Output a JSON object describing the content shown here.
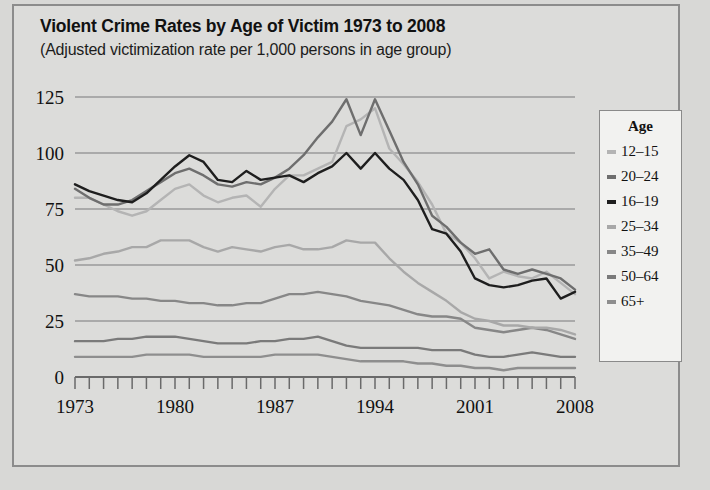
{
  "chart_data": {
    "type": "line",
    "title": "Violent Crime Rates by Age of Victim 1973 to 2008",
    "subtitle": "(Adjusted victimization rate per 1,000 persons in age group)",
    "xlabel": "",
    "ylabel": "",
    "xlim": [
      1973,
      2008
    ],
    "ylim": [
      0,
      125
    ],
    "yticks": [
      0,
      25,
      50,
      75,
      100,
      125
    ],
    "ytick_labels": [
      "0",
      "25",
      "50",
      "75",
      "100",
      "125"
    ],
    "xticks": [
      1973,
      1974,
      1975,
      1976,
      1977,
      1978,
      1979,
      1980,
      1981,
      1982,
      1983,
      1984,
      1985,
      1986,
      1987,
      1988,
      1989,
      1990,
      1991,
      1992,
      1993,
      1994,
      1995,
      1996,
      1997,
      1998,
      1999,
      2000,
      2001,
      2002,
      2003,
      2004,
      2005,
      2006,
      2007,
      2008
    ],
    "xtick_labels": [
      "1973",
      "1980",
      "1987",
      "1994",
      "2001",
      "2008"
    ],
    "xtick_label_years": [
      1973,
      1980,
      1987,
      1994,
      2001,
      2008
    ],
    "grid": true,
    "grid_axis": "y",
    "legend_position": "right",
    "legend_title": "Age",
    "x": [
      1973,
      1974,
      1975,
      1976,
      1977,
      1978,
      1979,
      1980,
      1981,
      1982,
      1983,
      1984,
      1985,
      1986,
      1987,
      1988,
      1989,
      1990,
      1991,
      1992,
      1993,
      1994,
      1995,
      1996,
      1997,
      1998,
      1999,
      2000,
      2001,
      2002,
      2003,
      2004,
      2005,
      2006,
      2007,
      2008
    ],
    "series": [
      {
        "name": "12–15",
        "color": "#b4b4b4",
        "values": [
          80,
          80,
          77,
          74,
          72,
          74,
          79,
          84,
          86,
          81,
          78,
          80,
          81,
          76,
          84,
          90,
          90,
          93,
          96,
          112,
          115,
          120,
          102,
          95,
          87,
          77,
          64,
          60,
          53,
          44,
          47,
          45,
          44,
          47,
          42,
          37
        ]
      },
      {
        "name": "20–24",
        "color": "#6e6e6e",
        "values": [
          84,
          80,
          77,
          77,
          79,
          83,
          87,
          91,
          93,
          90,
          86,
          85,
          87,
          86,
          89,
          93,
          99,
          107,
          114,
          124,
          108,
          124,
          110,
          96,
          86,
          72,
          67,
          60,
          55,
          57,
          48,
          46,
          48,
          46,
          44,
          39
        ]
      },
      {
        "name": "16–19",
        "color": "#1e1e1e",
        "values": [
          86,
          83,
          81,
          79,
          78,
          82,
          88,
          94,
          99,
          96,
          88,
          87,
          92,
          88,
          89,
          90,
          87,
          91,
          94,
          100,
          93,
          100,
          93,
          88,
          79,
          66,
          64,
          56,
          44,
          41,
          40,
          41,
          43,
          44,
          35,
          38
        ]
      },
      {
        "name": "25–34",
        "color": "#a8a8a8",
        "values": [
          52,
          53,
          55,
          56,
          58,
          58,
          61,
          61,
          61,
          58,
          56,
          58,
          57,
          56,
          58,
          59,
          57,
          57,
          58,
          61,
          60,
          60,
          53,
          47,
          42,
          38,
          34,
          29,
          26,
          25,
          23,
          23,
          22,
          22,
          21,
          19
        ]
      },
      {
        "name": "35–49",
        "color": "#878787",
        "values": [
          37,
          36,
          36,
          36,
          35,
          35,
          34,
          34,
          33,
          33,
          32,
          32,
          33,
          33,
          35,
          37,
          37,
          38,
          37,
          36,
          34,
          33,
          32,
          30,
          28,
          27,
          27,
          26,
          22,
          21,
          20,
          21,
          22,
          21,
          19,
          17
        ]
      },
      {
        "name": "50–64",
        "color": "#7a7a7a",
        "values": [
          16,
          16,
          16,
          17,
          17,
          18,
          18,
          18,
          17,
          16,
          15,
          15,
          15,
          16,
          16,
          17,
          17,
          18,
          16,
          14,
          13,
          13,
          13,
          13,
          13,
          12,
          12,
          12,
          10,
          9,
          9,
          10,
          11,
          10,
          9,
          9
        ]
      },
      {
        "name": "65+",
        "color": "#8e8e8e",
        "values": [
          9,
          9,
          9,
          9,
          9,
          10,
          10,
          10,
          10,
          9,
          9,
          9,
          9,
          9,
          10,
          10,
          10,
          10,
          9,
          8,
          7,
          7,
          7,
          7,
          6,
          6,
          5,
          5,
          4,
          4,
          3,
          4,
          4,
          4,
          4,
          4
        ]
      }
    ],
    "legend_entries": [
      {
        "label": "12–15",
        "color": "#b4b4b4"
      },
      {
        "label": "20–24",
        "color": "#6e6e6e"
      },
      {
        "label": "16–19",
        "color": "#1e1e1e"
      },
      {
        "label": "25–34",
        "color": "#a8a8a8"
      },
      {
        "label": "35–49",
        "color": "#878787"
      },
      {
        "label": "50–64",
        "color": "#7a7a7a"
      },
      {
        "label": "65+",
        "color": "#8e8e8e"
      }
    ],
    "colors": {
      "background": "#dcdcda",
      "page_background": "#d8d8d6",
      "grid": "#9a9a9a",
      "axis": "#6a6a6a",
      "text": "#111111",
      "legend_background": "#f2f2f0",
      "legend_border": "#8a8a8a",
      "figure_border": "#8c8c8c"
    }
  }
}
